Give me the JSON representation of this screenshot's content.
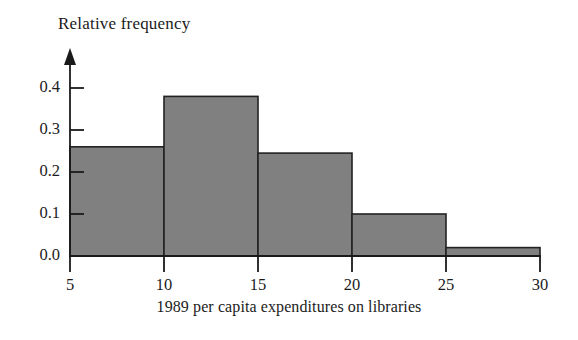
{
  "chart_data": {
    "type": "bar",
    "chart_subtype": "histogram",
    "title": "",
    "xlabel": "1989 per capita expenditures on libraries",
    "ylabel": "Relative frequency",
    "categories": [
      "5-10",
      "10-15",
      "15-20",
      "20-25",
      "25-30"
    ],
    "bin_edges": [
      5,
      10,
      15,
      20,
      25,
      30
    ],
    "values": [
      0.26,
      0.38,
      0.245,
      0.1,
      0.02
    ],
    "xlim": [
      5,
      30
    ],
    "ylim": [
      0.0,
      0.42
    ],
    "xticks": [
      5,
      10,
      15,
      20,
      25,
      30
    ],
    "xtick_labels": [
      "5",
      "10",
      "15",
      "20",
      "25",
      "30"
    ],
    "yticks": [
      0.0,
      0.1,
      0.2,
      0.3,
      0.4
    ],
    "ytick_labels": [
      "0.0",
      "0.1",
      "0.2",
      "0.3",
      "0.4"
    ],
    "grid": false,
    "legend": false,
    "legend_position": "none",
    "bar_fill_color": "#808080",
    "bar_edge_color": "#222222",
    "axis_color": "#1a1a1a",
    "y_axis_arrow": true
  },
  "labels": {
    "y_axis_title": "Relative frequency",
    "x_axis_title": "1989 per capita expenditures on libraries"
  }
}
